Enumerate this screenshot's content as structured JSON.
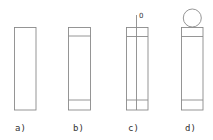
{
  "diagram": {
    "stroke_color": "#8a8a8a",
    "panels": [
      {
        "id": "a",
        "label": "a)"
      },
      {
        "id": "b",
        "label": "b)"
      },
      {
        "id": "c",
        "label": "c)",
        "axis_mark": "0"
      },
      {
        "id": "d",
        "label": "d)"
      }
    ]
  }
}
